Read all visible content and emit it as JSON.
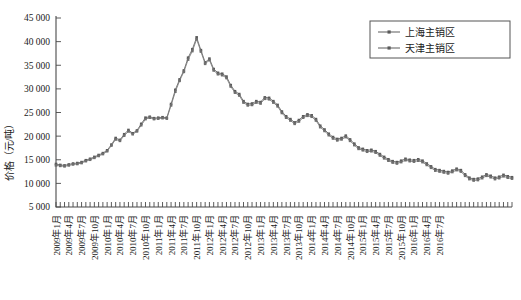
{
  "chart_data": {
    "type": "line",
    "title": "",
    "xlabel": "",
    "ylabel": "价格（元/吨）",
    "ylim": [
      5000,
      45000
    ],
    "ytick_labels": [
      "5 000",
      "10 000",
      "15 000",
      "20 000",
      "25 000",
      "30 000",
      "35 000",
      "40 000",
      "45 000"
    ],
    "ytick_values": [
      5000,
      10000,
      15000,
      20000,
      25000,
      30000,
      35000,
      40000,
      45000
    ],
    "grid": false,
    "legend_position": "top-right",
    "x_tick_interval_months": 1,
    "x_label_interval_months": 3,
    "xtick_labels": [
      "2009年1月",
      "2009年4月",
      "2009年7月",
      "2009年10月",
      "2010年1月",
      "2010年4月",
      "2010年7月",
      "2010年10月",
      "2011年1月",
      "2011年4月",
      "2011年7月",
      "2011年10月",
      "2012年1月",
      "2012年4月",
      "2012年7月",
      "2012年10月",
      "2013年1月",
      "2013年4月",
      "2013年7月",
      "2013年10月",
      "2014年1月",
      "2014年4月",
      "2014年7月",
      "2014年10月",
      "2015年1月",
      "2015年4月",
      "2015年7月",
      "2015年10月",
      "2016年1月",
      "2016年4月",
      "2016年7月"
    ],
    "x_start": "2009年1月",
    "x_end": "2016年7月",
    "series": [
      {
        "name": "上海主销区",
        "color": "#5a5a5a",
        "values": [
          14100,
          13900,
          13800,
          14000,
          14200,
          14300,
          14500,
          14900,
          15200,
          15600,
          16000,
          16400,
          17000,
          18200,
          19600,
          19200,
          20400,
          21300,
          20600,
          21200,
          22600,
          23900,
          24100,
          23800,
          23900,
          24000,
          23900,
          26800,
          29800,
          32000,
          33900,
          36600,
          38400,
          40900,
          38200,
          35600,
          36400,
          34200,
          33400,
          33200,
          32600,
          30800,
          29500,
          28900,
          27400,
          26800,
          26900,
          27400,
          27200,
          28200,
          28100,
          27400,
          26600,
          25200,
          24200,
          23600,
          22900,
          23400,
          24200,
          24600,
          24400,
          23600,
          22200,
          21400,
          20500,
          19800,
          19400,
          19600,
          20100,
          19300,
          18400,
          17600,
          17300,
          17000,
          17100,
          16800,
          16200,
          15600,
          15100,
          14700,
          14500,
          14800,
          15200,
          15000,
          14900,
          15100,
          14800,
          14200,
          13600,
          13000,
          12800,
          12600,
          12400,
          12700,
          13100,
          12800,
          11900,
          11200,
          10900,
          11000,
          11400,
          11900,
          11600,
          11200,
          11400,
          11800,
          11500,
          11300
        ]
      },
      {
        "name": "天津主销区",
        "color": "#6e6e6e",
        "values": [
          13800,
          13700,
          13600,
          13800,
          14000,
          14100,
          14300,
          14700,
          15000,
          15400,
          15800,
          16200,
          16800,
          18000,
          19300,
          19000,
          20100,
          21000,
          20400,
          21000,
          22300,
          23600,
          23900,
          23600,
          23700,
          23800,
          23700,
          26500,
          29400,
          31700,
          33600,
          36200,
          38000,
          40500,
          37900,
          35300,
          36100,
          33900,
          33100,
          32900,
          32300,
          30500,
          29200,
          28600,
          27100,
          26500,
          26600,
          27100,
          26900,
          27900,
          27800,
          27100,
          26300,
          24900,
          23900,
          23300,
          22600,
          23100,
          23900,
          24300,
          24100,
          23300,
          21900,
          21100,
          20200,
          19500,
          19100,
          19300,
          19800,
          19000,
          18100,
          17300,
          17000,
          16700,
          16800,
          16500,
          15900,
          15300,
          14800,
          14400,
          14200,
          14500,
          14900,
          14700,
          14600,
          14800,
          14500,
          13900,
          13300,
          12700,
          12500,
          12300,
          12100,
          12400,
          12800,
          12500,
          11600,
          10900,
          10600,
          10700,
          11100,
          11600,
          11300,
          10900,
          11100,
          11500,
          11200,
          11000
        ]
      }
    ]
  }
}
